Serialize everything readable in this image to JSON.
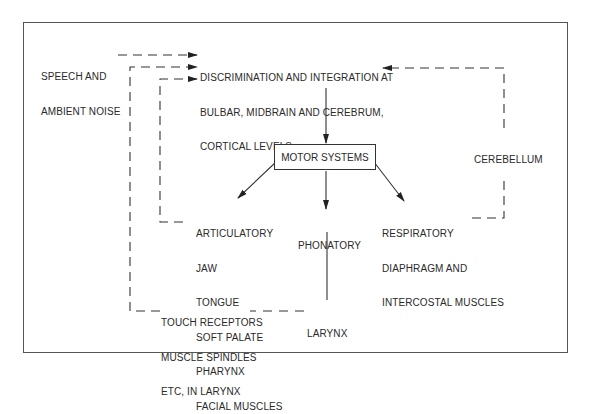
{
  "diagram": {
    "type": "flow-diagram",
    "topic": "Speech motor control feedback loops",
    "nodes": {
      "input": {
        "lines": [
          "SPEECH AND",
          "AMBIENT NOISE"
        ]
      },
      "integration": {
        "lines": [
          "DISCRIMINATION AND INTEGRATION AT",
          "BULBAR, MIDBRAIN AND CEREBRUM,",
          "CORTICAL LEVELS"
        ]
      },
      "motor_systems": {
        "label": "MOTOR SYSTEMS"
      },
      "articulatory": {
        "lines": [
          "ARTICULATORY",
          "JAW",
          "TONGUE",
          "SOFT PALATE",
          "PHARYNX",
          "FACIAL MUSCLES"
        ]
      },
      "phonatory": {
        "label": "PHONATORY"
      },
      "respiratory": {
        "lines": [
          "RESPIRATORY",
          "DIAPHRAGM AND",
          "INTERCOSTAL MUSCLES"
        ]
      },
      "cerebellum": {
        "label": "CEREBELLUM"
      },
      "larynx": {
        "label": "LARYNX"
      },
      "receptors": {
        "lines": [
          "TOUCH RECEPTORS",
          "MUSCLE SPINDLES",
          "ETC, IN LARYNX"
        ]
      }
    },
    "edges": [
      {
        "from": "input",
        "to": "integration",
        "style": "dashed"
      },
      {
        "from": "receptors",
        "to": "integration",
        "style": "dashed"
      },
      {
        "from": "articulatory",
        "to": "integration",
        "style": "dashed"
      },
      {
        "from": "cerebellum",
        "to": "integration",
        "style": "dashed"
      },
      {
        "from": "respiratory",
        "to": "cerebellum",
        "style": "dashed"
      },
      {
        "from": "integration",
        "to": "motor_systems",
        "style": "solid"
      },
      {
        "from": "motor_systems",
        "to": "articulatory",
        "style": "solid"
      },
      {
        "from": "motor_systems",
        "to": "phonatory",
        "style": "solid"
      },
      {
        "from": "motor_systems",
        "to": "respiratory",
        "style": "solid"
      },
      {
        "from": "phonatory",
        "to": "larynx",
        "style": "solid"
      },
      {
        "from": "larynx",
        "to": "receptors",
        "style": "dashed"
      }
    ]
  }
}
